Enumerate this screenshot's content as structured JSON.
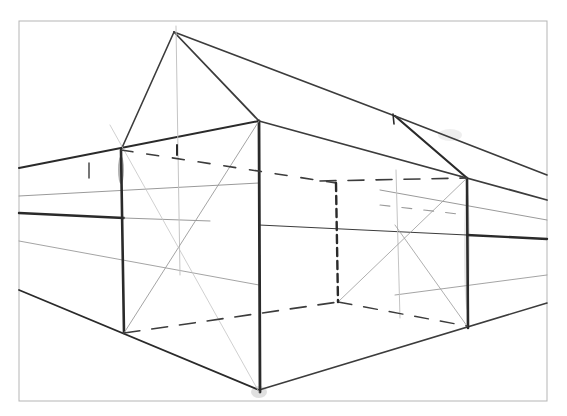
{
  "image": {
    "subject": "Pencil sketch of a house in two-point perspective",
    "width": 567,
    "height": 416,
    "background": "#ffffff",
    "frame": {
      "x": 19,
      "y": 21,
      "w": 528,
      "h": 380,
      "stroke": "#b5b5b5"
    }
  },
  "colors": {
    "heavy": "#2a2a2a",
    "medium": "#3c3c3c",
    "light": "#9a9a9a",
    "faint": "#c4c4c4"
  },
  "lines": [
    {
      "id": "roof-left-slope",
      "x1": 174,
      "y1": 32,
      "x2": 121,
      "y2": 150,
      "w": 1.6,
      "tone": "medium"
    },
    {
      "id": "roof-front-slope",
      "x1": 174,
      "y1": 32,
      "x2": 259,
      "y2": 121,
      "w": 1.8,
      "tone": "medium"
    },
    {
      "id": "roof-ridge",
      "x1": 174,
      "y1": 32,
      "x2": 395,
      "y2": 116,
      "w": 1.6,
      "tone": "medium"
    },
    {
      "id": "roof-back-slope",
      "x1": 395,
      "y1": 116,
      "x2": 467,
      "y2": 178,
      "w": 2.2,
      "tone": "heavy"
    },
    {
      "id": "ridge-extension",
      "x1": 395,
      "y1": 116,
      "x2": 547,
      "y2": 175,
      "w": 1.6,
      "tone": "medium"
    },
    {
      "id": "eave-left",
      "x1": 19,
      "y1": 168,
      "x2": 259,
      "y2": 121,
      "w": 2.0,
      "tone": "heavy"
    },
    {
      "id": "eave-right",
      "x1": 259,
      "y1": 121,
      "x2": 547,
      "y2": 200,
      "w": 1.8,
      "tone": "medium"
    },
    {
      "id": "ground-left",
      "x1": 19,
      "y1": 290,
      "x2": 259,
      "y2": 390,
      "w": 1.8,
      "tone": "heavy"
    },
    {
      "id": "ground-right",
      "x1": 259,
      "y1": 390,
      "x2": 547,
      "y2": 303,
      "w": 1.6,
      "tone": "medium"
    },
    {
      "id": "horizon-left",
      "x1": 19,
      "y1": 213,
      "x2": 124,
      "y2": 218,
      "w": 2.4,
      "tone": "heavy"
    },
    {
      "id": "horizon-left-faint",
      "x1": 124,
      "y1": 218,
      "x2": 210,
      "y2": 221,
      "w": 1.0,
      "tone": "light"
    },
    {
      "id": "horizon-mid",
      "x1": 259,
      "y1": 225,
      "x2": 467,
      "y2": 235,
      "w": 1.2,
      "tone": "medium"
    },
    {
      "id": "horizon-right",
      "x1": 467,
      "y1": 235,
      "x2": 547,
      "y2": 239,
      "w": 2.4,
      "tone": "heavy"
    },
    {
      "id": "guide-upper-left",
      "x1": 19,
      "y1": 196,
      "x2": 259,
      "y2": 183,
      "w": 1.0,
      "tone": "light"
    },
    {
      "id": "guide-upper-right",
      "x1": 380,
      "y1": 190,
      "x2": 547,
      "y2": 220,
      "w": 1.0,
      "tone": "light"
    },
    {
      "id": "guide-lower-left",
      "x1": 19,
      "y1": 241,
      "x2": 259,
      "y2": 285,
      "w": 0.9,
      "tone": "light"
    },
    {
      "id": "guide-lower-right",
      "x1": 395,
      "y1": 295,
      "x2": 547,
      "y2": 275,
      "w": 0.9,
      "tone": "light"
    },
    {
      "id": "edge-left-corner",
      "x1": 121,
      "y1": 150,
      "x2": 124,
      "y2": 333,
      "w": 2.6,
      "tone": "heavy"
    },
    {
      "id": "edge-front-corner",
      "x1": 259,
      "y1": 121,
      "x2": 260,
      "y2": 392,
      "w": 2.8,
      "tone": "heavy"
    },
    {
      "id": "edge-right-corner",
      "x1": 467,
      "y1": 178,
      "x2": 468,
      "y2": 328,
      "w": 2.6,
      "tone": "heavy"
    },
    {
      "id": "gable-center-vertical",
      "x1": 176,
      "y1": 26,
      "x2": 180,
      "y2": 275,
      "w": 1.0,
      "tone": "faint"
    },
    {
      "id": "back-wall-vertical",
      "x1": 396,
      "y1": 170,
      "x2": 400,
      "y2": 318,
      "w": 1.0,
      "tone": "faint"
    },
    {
      "id": "diag-left-1",
      "x1": 124,
      "y1": 333,
      "x2": 259,
      "y2": 121,
      "w": 0.9,
      "tone": "light"
    },
    {
      "id": "diag-left-2",
      "x1": 110,
      "y1": 125,
      "x2": 259,
      "y2": 392,
      "w": 0.8,
      "tone": "faint"
    },
    {
      "id": "diag-right-1",
      "x1": 338,
      "y1": 302,
      "x2": 467,
      "y2": 178,
      "w": 0.8,
      "tone": "light"
    },
    {
      "id": "diag-right-2",
      "x1": 395,
      "y1": 225,
      "x2": 467,
      "y2": 326,
      "w": 0.8,
      "tone": "light"
    },
    {
      "id": "eave-tick",
      "x1": 89,
      "y1": 163,
      "x2": 89,
      "y2": 178,
      "w": 1.4,
      "tone": "medium"
    },
    {
      "id": "ridge-tick",
      "x1": 177,
      "y1": 145,
      "x2": 177,
      "y2": 155,
      "w": 2.0,
      "tone": "heavy"
    },
    {
      "id": "back-ridge-tick",
      "x1": 393,
      "y1": 114,
      "x2": 394,
      "y2": 124,
      "w": 1.6,
      "tone": "heavy"
    }
  ],
  "dashed_lines": [
    {
      "id": "hidden-top-left",
      "x1": 121,
      "y1": 150,
      "x2": 336,
      "y2": 183,
      "w": 1.6,
      "dash": "12 14",
      "tone": "medium"
    },
    {
      "id": "hidden-top-right",
      "x1": 320,
      "y1": 181,
      "x2": 467,
      "y2": 178,
      "w": 1.6,
      "dash": "16 12",
      "tone": "medium"
    },
    {
      "id": "hidden-bottom-left",
      "x1": 124,
      "y1": 333,
      "x2": 338,
      "y2": 302,
      "w": 1.6,
      "dash": "16 12",
      "tone": "medium"
    },
    {
      "id": "hidden-bottom-right",
      "x1": 338,
      "y1": 302,
      "x2": 467,
      "y2": 326,
      "w": 1.4,
      "dash": "14 12",
      "tone": "medium"
    },
    {
      "id": "hidden-back-corner",
      "x1": 336,
      "y1": 183,
      "x2": 338,
      "y2": 302,
      "w": 2.4,
      "dash": "8 5",
      "tone": "heavy"
    },
    {
      "id": "hidden-right-guide",
      "x1": 380,
      "y1": 205,
      "x2": 467,
      "y2": 215,
      "w": 1.1,
      "dash": "10 12",
      "tone": "light"
    }
  ],
  "smudges": [
    {
      "cx": 121,
      "cy": 170,
      "rx": 3,
      "ry": 14,
      "opacity": 0.45
    },
    {
      "cx": 259,
      "cy": 392,
      "rx": 8,
      "ry": 6,
      "opacity": 0.18
    },
    {
      "cx": 450,
      "cy": 135,
      "rx": 12,
      "ry": 6,
      "opacity": 0.1
    },
    {
      "cx": 467,
      "cy": 250,
      "rx": 3,
      "ry": 60,
      "opacity": 0.15
    }
  ]
}
